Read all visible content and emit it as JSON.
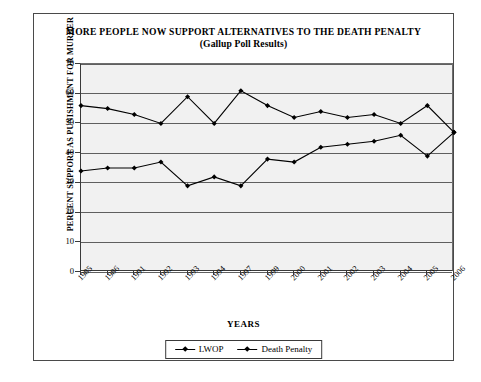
{
  "chart_data": {
    "type": "line",
    "title": "MORE PEOPLE NOW SUPPORT ALTERNATIVES TO THE DEATH PENALTY",
    "subtitle": "(Gallup Poll Results)",
    "xlabel": "YEARS",
    "ylabel": "PERCENT SUPPORT AS PUNISHMENT FOR MURDER",
    "categories": [
      "1985",
      "1986",
      "1991",
      "1992",
      "1993",
      "1994",
      "1997",
      "1999",
      "2000",
      "2001",
      "2002",
      "2003",
      "2004",
      "2005",
      "2006"
    ],
    "ylim": [
      0,
      70
    ],
    "yticks": [
      0,
      10,
      20,
      30,
      40,
      50,
      60,
      70
    ],
    "grid": true,
    "legend_position": "bottom",
    "series": [
      {
        "name": "LWOP",
        "marker": "diamond",
        "color": "#000000",
        "values": [
          34,
          35,
          35,
          37,
          29,
          32,
          29,
          38,
          37,
          42,
          43,
          44,
          46,
          39,
          47
        ]
      },
      {
        "name": "Death Penalty",
        "marker": "diamond",
        "color": "#000000",
        "values": [
          56,
          55,
          53,
          50,
          59,
          50,
          61,
          56,
          52,
          54,
          52,
          53,
          50,
          56,
          47
        ]
      }
    ]
  },
  "figure": {
    "background_color": "#ffffff",
    "plot_background_color": "#f1f1f1",
    "frame_color": "#4a4a4a",
    "gridline_color": "#5f5f5f",
    "axis_color": "#3a3a3a"
  }
}
